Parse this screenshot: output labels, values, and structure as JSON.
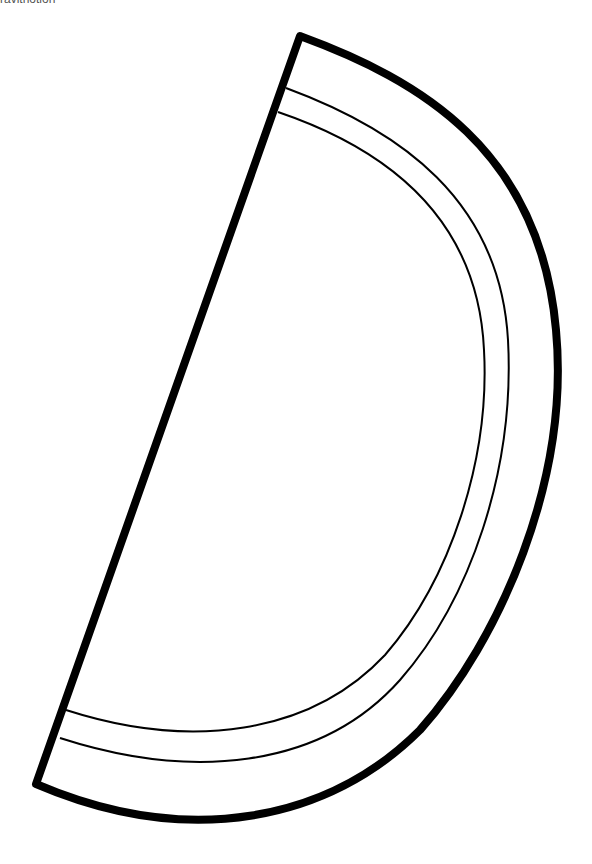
{
  "caption": "ravitnotion",
  "drawing": {
    "subject": "watermelon-slice-outline",
    "stroke_color": "#000000",
    "fill_color": "#ffffff",
    "outer_stroke_width": 8,
    "inner_stroke_width": 2
  }
}
